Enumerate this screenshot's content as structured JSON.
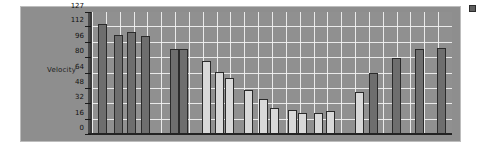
{
  "chart_data": {
    "type": "bar",
    "title": "",
    "subtitle": "",
    "xlabel": "",
    "ylabel": "Velocity",
    "ylim": [
      0,
      127
    ],
    "xlim": [
      0,
      26
    ],
    "grid": true,
    "grid_color": "#f2f2f2",
    "plot_background": "#909090",
    "legend_position": "top-right-cropped",
    "axis_tick_labels": [
      "127",
      "112",
      "96",
      "80",
      "64",
      "48",
      "32",
      "16",
      "0"
    ],
    "axis_tick_values": [
      127,
      112,
      96,
      80,
      64,
      48,
      32,
      16,
      0
    ],
    "categories": [
      "1",
      "2",
      "3",
      "4",
      "5",
      "6",
      "7",
      "8",
      "9",
      "10",
      "11",
      "12",
      "13",
      "14",
      "15",
      "16",
      "17",
      "18",
      "19",
      "20",
      "21",
      "22",
      "23",
      "24",
      "25",
      "26"
    ],
    "values": [
      115,
      0,
      103,
      106,
      102,
      0,
      0,
      89,
      89,
      0,
      76,
      65,
      58,
      0,
      46,
      36,
      27,
      0,
      25,
      22,
      0,
      22,
      24,
      0,
      44,
      0
    ],
    "bar_shades": [
      "dark",
      "none",
      "dark",
      "dark",
      "dark",
      "none",
      "none",
      "dark",
      "dark",
      "none",
      "light",
      "light",
      "light",
      "none",
      "light",
      "light",
      "light",
      "none",
      "light",
      "light",
      "none",
      "light",
      "light",
      "none",
      "light",
      "none"
    ],
    "series": [
      {
        "name": "Velocity",
        "values": [
          115,
          0,
          103,
          106,
          102,
          0,
          0,
          89,
          89,
          0,
          76,
          65,
          58,
          0,
          46,
          36,
          27,
          0,
          25,
          22,
          0,
          22,
          24,
          0,
          44,
          0
        ]
      }
    ],
    "bars": [
      {
        "index": 0,
        "x_px": 6,
        "value": 115,
        "shade": "dark"
      },
      {
        "index": 1,
        "x_px": 22,
        "value": 103,
        "shade": "dark"
      },
      {
        "index": 2,
        "x_px": 35,
        "value": 106,
        "shade": "dark"
      },
      {
        "index": 3,
        "x_px": 49,
        "value": 102,
        "shade": "dark"
      },
      {
        "index": 4,
        "x_px": 78,
        "value": 89,
        "shade": "dark"
      },
      {
        "index": 5,
        "x_px": 87,
        "value": 89,
        "shade": "dark"
      },
      {
        "index": 6,
        "x_px": 110,
        "value": 76,
        "shade": "light"
      },
      {
        "index": 7,
        "x_px": 123,
        "value": 65,
        "shade": "light"
      },
      {
        "index": 8,
        "x_px": 133,
        "value": 58,
        "shade": "light"
      },
      {
        "index": 9,
        "x_px": 152,
        "value": 46,
        "shade": "light"
      },
      {
        "index": 10,
        "x_px": 167,
        "value": 36,
        "shade": "light"
      },
      {
        "index": 11,
        "x_px": 178,
        "value": 27,
        "shade": "light"
      },
      {
        "index": 12,
        "x_px": 196,
        "value": 25,
        "shade": "light"
      },
      {
        "index": 13,
        "x_px": 206,
        "value": 22,
        "shade": "light"
      },
      {
        "index": 14,
        "x_px": 222,
        "value": 22,
        "shade": "light"
      },
      {
        "index": 15,
        "x_px": 234,
        "value": 24,
        "shade": "light"
      },
      {
        "index": 16,
        "x_px": 263,
        "value": 44,
        "shade": "light"
      },
      {
        "index": 17,
        "x_px": 277,
        "value": 64,
        "shade": "dark"
      },
      {
        "index": 18,
        "x_px": 300,
        "value": 79,
        "shade": "dark"
      },
      {
        "index": 19,
        "x_px": 323,
        "value": 88,
        "shade": "dark"
      },
      {
        "index": 20,
        "x_px": 345,
        "value": 90,
        "shade": "dark"
      }
    ]
  },
  "legend": {
    "label": "",
    "swatch_color": "#5f5f5f"
  },
  "colors": {
    "panel": "#8e8e8e",
    "plot": "#909090",
    "gridline": "#f2f2f2",
    "bar_dark": "#6e6e6e",
    "bar_light": "#d8d8d8",
    "bar_outline": "#2b2b2b",
    "axis": "#232323",
    "text": "#111111"
  }
}
